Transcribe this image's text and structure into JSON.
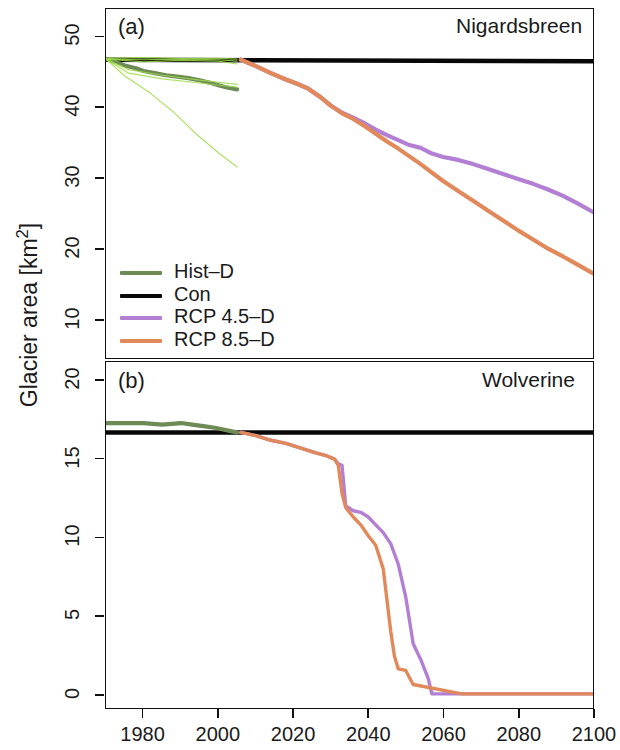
{
  "figure": {
    "ylabel": "Glacier area [km",
    "ylabel_sup": "2",
    "ylabel_close": "]"
  },
  "panels": [
    {
      "tag": "(a)",
      "name": "Nigardsbreen"
    },
    {
      "tag": "(b)",
      "name": "Wolverine"
    }
  ],
  "legend": {
    "items": [
      {
        "label": "Hist–D",
        "color": "#6e8b56"
      },
      {
        "label": "Con",
        "color": "#080808"
      },
      {
        "label": "RCP 4.5–D",
        "color": "#b37fd4"
      },
      {
        "label": "RCP 8.5–D",
        "color": "#e2895b"
      }
    ]
  },
  "axis_labels": {
    "x_ticks": [
      "1980",
      "2000",
      "2020",
      "2040",
      "2060",
      "2080",
      "2100"
    ],
    "y_ticks_a": [
      "10",
      "20",
      "30",
      "40",
      "50"
    ],
    "y_ticks_b": [
      "0",
      "5",
      "10",
      "15",
      "20"
    ]
  },
  "chart_data": {
    "type": "line",
    "title": "",
    "xlabel": "",
    "ylabel": "Glacier area [km2]",
    "xlim": [
      1970,
      2100
    ],
    "grid": false,
    "legend_position": "lower-left of panel (a)",
    "panels": [
      {
        "tag": "(a)",
        "name": "Nigardsbreen",
        "ylim": [
          4.5,
          54
        ],
        "y_ticks": [
          10,
          20,
          30,
          40,
          50
        ],
        "x_ticks": [
          1980,
          2000,
          2020,
          2040,
          2060,
          2080,
          2100
        ],
        "series": [
          {
            "name": "Con",
            "color": "#080808",
            "width": 4.6,
            "x": [
              1970,
              2100
            ],
            "y": [
              46.8,
              46.6
            ]
          },
          {
            "name": "Hist-D",
            "color": "#6e8b56",
            "width": 4.2,
            "x": [
              1970,
              1972,
              1975,
              1978,
              1980,
              1983,
              1986,
              1989,
              1992,
              1995,
              1998,
              2000,
              2002,
              2004,
              2005
            ],
            "y": [
              46.9,
              46.6,
              46.0,
              45.6,
              45.2,
              44.9,
              44.6,
              44.4,
              44.2,
              43.9,
              43.5,
              43.2,
              42.9,
              42.7,
              42.6
            ]
          },
          {
            "name": "RCP 4.5-D",
            "color": "#b37fd4",
            "width": 4.2,
            "x": [
              2006,
              2010,
              2014,
              2018,
              2021,
              2024,
              2027,
              2030,
              2033,
              2036,
              2039,
              2042,
              2045,
              2048,
              2051,
              2054,
              2057,
              2060,
              2064,
              2068,
              2072,
              2076,
              2080,
              2084,
              2088,
              2092,
              2096,
              2100
            ],
            "y": [
              46.8,
              45.9,
              44.9,
              44.0,
              43.4,
              42.7,
              41.6,
              40.3,
              39.3,
              38.6,
              37.8,
              36.9,
              36.1,
              35.4,
              34.7,
              34.3,
              33.5,
              33.0,
              32.6,
              32.0,
              31.3,
              30.6,
              29.9,
              29.2,
              28.4,
              27.5,
              26.4,
              25.2
            ]
          },
          {
            "name": "RCP 8.5-D",
            "color": "#e2895b",
            "width": 4.2,
            "x": [
              2006,
              2010,
              2014,
              2018,
              2021,
              2024,
              2027,
              2030,
              2033,
              2036,
              2039,
              2042,
              2045,
              2048,
              2051,
              2054,
              2057,
              2060,
              2064,
              2068,
              2072,
              2076,
              2080,
              2084,
              2088,
              2092,
              2096,
              2100
            ],
            "y": [
              46.8,
              45.9,
              44.9,
              44.0,
              43.4,
              42.7,
              41.6,
              40.3,
              39.2,
              38.4,
              37.4,
              36.3,
              35.2,
              34.2,
              33.1,
              32.0,
              30.8,
              29.6,
              28.2,
              26.8,
              25.4,
              24.0,
              22.6,
              21.3,
              20.0,
              18.9,
              17.7,
              16.5
            ]
          },
          {
            "name": "Hist-D ensemble members",
            "color": "#9fdc4a",
            "width": 1.2,
            "members": [
              {
                "x": [
                  1970,
                  1980,
                  1990,
                  2000,
                  2005
                ],
                "y": [
                  47.0,
                  47.1,
                  47.0,
                  47.0,
                  46.9
                ]
              },
              {
                "x": [
                  1970,
                  1980,
                  1990,
                  2000,
                  2005
                ],
                "y": [
                  46.9,
                  46.8,
                  46.9,
                  46.8,
                  46.6
                ]
              },
              {
                "x": [
                  1970,
                  1980,
                  1990,
                  2000,
                  2005
                ],
                "y": [
                  46.9,
                  46.5,
                  46.7,
                  46.6,
                  46.2
                ]
              },
              {
                "x": [
                  1970,
                  1976,
                  1985,
                  1995,
                  2005
                ],
                "y": [
                  46.9,
                  45.4,
                  44.6,
                  43.9,
                  43.3
                ]
              },
              {
                "x": [
                  1970,
                  1976,
                  1985,
                  1995,
                  2005
                ],
                "y": [
                  46.9,
                  44.9,
                  44.1,
                  43.5,
                  42.9
                ]
              },
              {
                "x": [
                  1970,
                  1975,
                  1982,
                  1988,
                  1994,
                  2000,
                  2005
                ],
                "y": [
                  46.9,
                  44.5,
                  42.0,
                  39.4,
                  36.3,
                  33.6,
                  31.6
                ]
              }
            ]
          }
        ]
      },
      {
        "tag": "(b)",
        "name": "Wolverine",
        "ylim": [
          -0.9,
          21.2
        ],
        "y_ticks": [
          0,
          5,
          10,
          15,
          20
        ],
        "x_ticks": [
          1980,
          2000,
          2020,
          2040,
          2060,
          2080,
          2100
        ],
        "series": [
          {
            "name": "Con",
            "color": "#080808",
            "width": 4.6,
            "x": [
              1970,
              2100
            ],
            "y": [
              16.7,
              16.7
            ]
          },
          {
            "name": "Hist-D",
            "color": "#6e8b56",
            "width": 4.2,
            "x": [
              1970,
              1975,
              1980,
              1985,
              1990,
              1993,
              1996,
              1999,
              2001,
              2003,
              2005
            ],
            "y": [
              17.3,
              17.3,
              17.3,
              17.2,
              17.3,
              17.2,
              17.1,
              17.0,
              16.9,
              16.8,
              16.7
            ]
          },
          {
            "name": "RCP 4.5-D",
            "color": "#b37fd4",
            "width": 3.4,
            "x": [
              2006,
              2010,
              2014,
              2018,
              2022,
              2026,
              2029,
              2031,
              2032,
              2033,
              2034,
              2036,
              2038,
              2040,
              2042,
              2044,
              2046,
              2048,
              2050,
              2052,
              2054,
              2056,
              2057,
              2060,
              2100
            ],
            "y": [
              16.7,
              16.5,
              16.2,
              16.0,
              15.7,
              15.4,
              15.2,
              15.0,
              14.7,
              14.6,
              12.0,
              11.7,
              11.6,
              11.3,
              10.8,
              10.3,
              9.6,
              8.3,
              6.2,
              3.2,
              2.2,
              1.0,
              0.0,
              0.0,
              0.0
            ]
          },
          {
            "name": "RCP 8.5-D",
            "color": "#e2895b",
            "width": 3.4,
            "x": [
              2006,
              2010,
              2014,
              2018,
              2022,
              2026,
              2029,
              2031,
              2032,
              2033,
              2034,
              2036,
              2038,
              2040,
              2042,
              2044,
              2045,
              2046,
              2047,
              2048,
              2050,
              2052,
              2065,
              2100
            ],
            "y": [
              16.7,
              16.5,
              16.2,
              16.0,
              15.7,
              15.4,
              15.2,
              15.0,
              14.6,
              12.8,
              11.9,
              11.3,
              10.8,
              10.1,
              9.5,
              8.0,
              6.0,
              4.0,
              2.4,
              1.6,
              1.5,
              0.6,
              0.0,
              0.0
            ]
          }
        ]
      }
    ]
  }
}
